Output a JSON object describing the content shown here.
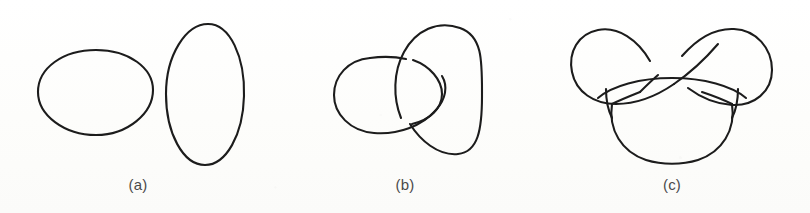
{
  "figure": {
    "background_color": "#fdfdfc",
    "stroke_color": "#1c1c1c",
    "label_color": "#4a4a4a"
  },
  "panels": [
    {
      "id": "a",
      "label": "(a)",
      "name": "unlink-two-components",
      "description": "Two separate unlinked closed loops (the unlink): a horizontal ellipse on the left and a vertical ellipse on the right",
      "components": 2,
      "crossings": 0,
      "label_center_x": 138,
      "label_center_y": 190
    },
    {
      "id": "b",
      "label": "(b)",
      "name": "hopf-link",
      "description": "Two interlocking loops forming a Hopf link; the right loop passes over at the upper crossing and under at the lower crossing",
      "components": 2,
      "crossings": 2,
      "label_center_x": 405,
      "label_center_y": 190
    },
    {
      "id": "c",
      "label": "(c)",
      "name": "trefoil-knot",
      "description": "A single closed curve forming a trefoil knot with two upper lobes, a horizontal sweep across the middle, and a large lower lobe",
      "components": 1,
      "crossings": 3,
      "label_center_x": 672,
      "label_center_y": 190
    }
  ]
}
